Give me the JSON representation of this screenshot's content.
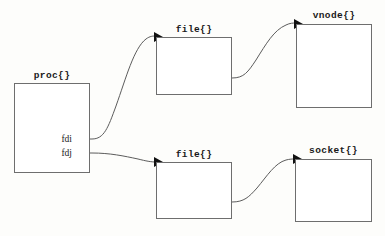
{
  "diagram": {
    "background_color": "#fdfdfb",
    "border_color": "#6e6e6e",
    "line_color": "#5c5c5c",
    "arrow_color": "#111111",
    "width": 385,
    "height": 236
  },
  "nodes": [
    {
      "id": "proc",
      "label": "proc{}",
      "x": 14,
      "y": 83,
      "w": 76,
      "h": 90,
      "label_x": 14,
      "label_y": 70,
      "label_w": 76
    },
    {
      "id": "file_top",
      "label": "file{}",
      "x": 156,
      "y": 37,
      "w": 76,
      "h": 58,
      "label_x": 156,
      "label_y": 24,
      "label_w": 76
    },
    {
      "id": "vnode",
      "label": "vnode{}",
      "x": 296,
      "y": 24,
      "w": 76,
      "h": 84,
      "label_x": 296,
      "label_y": 10,
      "label_w": 76
    },
    {
      "id": "file_bottom",
      "label": "file{}",
      "x": 156,
      "y": 162,
      "w": 76,
      "h": 57,
      "label_x": 156,
      "label_y": 149,
      "label_w": 76
    },
    {
      "id": "socket",
      "label": "socket{}",
      "x": 295,
      "y": 159,
      "w": 77,
      "h": 63,
      "label_x": 295,
      "label_y": 145,
      "label_w": 77
    }
  ],
  "fd_labels": [
    {
      "id": "fdi",
      "text": "fdi",
      "x": 50,
      "y": 134,
      "w": 22
    },
    {
      "id": "fdj",
      "text": "fdj",
      "x": 50,
      "y": 148,
      "w": 22
    }
  ],
  "connectors": [
    {
      "id": "fdi-to-file-top",
      "from": "proc.fdi",
      "to": "file_top",
      "stub": "M 72 139 L 92 139",
      "path": "M 92 139 C 104 139, 108 128, 116 106 C 126 78, 134 48, 146 39 C 150 36, 153 36, 156 36",
      "arrow": "154,32 154,42 163,37"
    },
    {
      "id": "file-top-to-vnode",
      "from": "file_top",
      "to": "vnode",
      "stub": "M 216 78 L 232 78",
      "path": "M 232 78 C 244 78, 248 72, 256 60 C 266 44, 274 30, 286 25 C 290 23, 293 23, 296 23",
      "arrow": "294,19 294,29 303,24"
    },
    {
      "id": "fdj-to-file-bottom",
      "from": "proc.fdj",
      "to": "file_bottom",
      "stub": "M 72 153 L 92 153",
      "path": "M 92 153 C 110 153, 124 156, 138 159 C 146 161, 151 162, 156 162",
      "arrow": "154,157 154,167 163,162"
    },
    {
      "id": "file-bottom-to-socket",
      "from": "file_bottom",
      "to": "socket",
      "stub": "M 216 202 L 232 202",
      "path": "M 232 202 C 244 202, 249 197, 257 188 C 267 176, 275 163, 286 160 C 290 159, 292 159, 295 159",
      "arrow": "293,154 293,164 302,159"
    }
  ]
}
